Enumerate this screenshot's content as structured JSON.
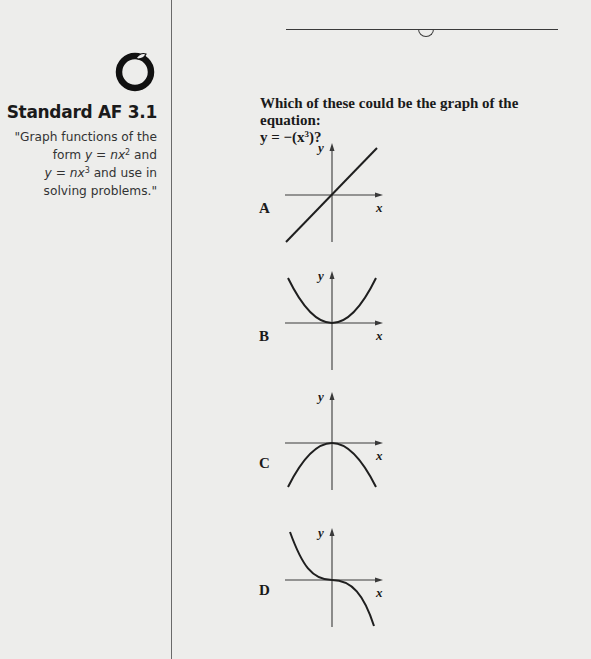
{
  "sidebar": {
    "icon": "apple-icon",
    "standard_title": "Standard AF 3.1",
    "description_lines": [
      "\"Graph functions of the",
      "form y = nx² and",
      "y = nx³ and use in",
      "solving problems.\""
    ],
    "description_parts": {
      "line1": "\"Graph functions of the",
      "line2_pre": "form ",
      "line2_math": "y = nx",
      "line2_exp": "2",
      "line2_post": " and",
      "line3_math": "y = nx",
      "line3_exp": "3",
      "line3_post": " and use in",
      "line4": "solving problems.\""
    }
  },
  "question": {
    "text": "Which of these could be the graph of the equation:",
    "equation_pre": "y = −(x",
    "equation_exp": "3",
    "equation_post": ")?"
  },
  "choices": [
    {
      "label": "A",
      "shape": "line through origin, positive slope"
    },
    {
      "label": "B",
      "shape": "upward parabola, vertex at origin"
    },
    {
      "label": "C",
      "shape": "downward parabola, vertex at origin"
    },
    {
      "label": "D",
      "shape": "decreasing cubic through origin"
    }
  ],
  "axes": {
    "x_label": "x",
    "y_label": "y"
  },
  "colors": {
    "background": "#ededeb",
    "ink": "#1a1a1a",
    "divider": "#6a6a6a"
  }
}
